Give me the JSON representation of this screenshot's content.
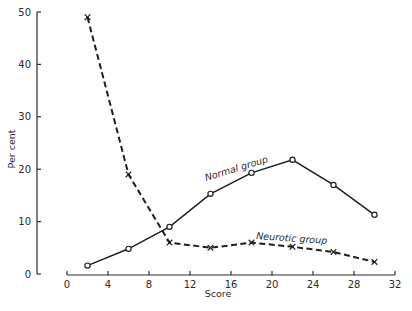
{
  "chart_data": {
    "type": "line",
    "title": "",
    "xlabel": "Score",
    "ylabel": "Per cent",
    "xlim": [
      0,
      32
    ],
    "ylim": [
      0,
      50
    ],
    "x_ticks": [
      0,
      4,
      8,
      12,
      16,
      20,
      24,
      28,
      32
    ],
    "y_ticks": [
      0,
      10,
      20,
      30,
      40,
      50
    ],
    "grid": false,
    "legend": "none (inline series labels)",
    "series": [
      {
        "name": "Normal group",
        "line_style": "solid",
        "marker": "circle",
        "label_text": "Normal group",
        "x": [
          2,
          6,
          10,
          14,
          18,
          22,
          26,
          30
        ],
        "values": [
          1.6,
          4.8,
          9,
          15.3,
          19.3,
          21.8,
          17,
          11.3
        ]
      },
      {
        "name": "Neurotic group",
        "line_style": "dashed",
        "marker": "x",
        "label_text": "Neurotic group",
        "x": [
          2,
          6,
          10,
          14,
          18,
          22,
          26,
          30
        ],
        "values": [
          49,
          19,
          6,
          5,
          6,
          5.2,
          4.2,
          2.3
        ]
      }
    ]
  },
  "colors": {
    "background": "#ffffff",
    "ink": "#1e1e1e"
  }
}
